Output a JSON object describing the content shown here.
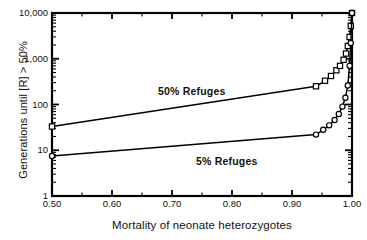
{
  "chart_data": {
    "type": "line",
    "title": "",
    "xlabel": "Mortality of neonate heterozygotes",
    "ylabel": "Generations until [R] > 50%",
    "xlim": [
      0.5,
      1.0
    ],
    "ylim": [
      1,
      10000
    ],
    "yscale": "log",
    "xscale": "linear",
    "grid": false,
    "legend_position": "inline-annotation",
    "xticks": [
      "0.50",
      "0.60",
      "0.70",
      "0.80",
      "0.90",
      "1.00"
    ],
    "xtick_values": [
      0.5,
      0.6,
      0.7,
      0.8,
      0.9,
      1.0
    ],
    "yticks": [
      "1",
      "10",
      "100",
      "1,000",
      "10,000"
    ],
    "ytick_values": [
      1,
      10,
      100,
      1000,
      10000
    ],
    "annotations": [
      {
        "text": "50%  Refuges",
        "x": 0.7,
        "y": 330
      },
      {
        "text": "5%  Refuges",
        "x": 0.79,
        "y": 17
      }
    ],
    "series": [
      {
        "name": "50% Refuges",
        "marker": "square",
        "x": [
          0.5,
          0.94,
          0.955,
          0.965,
          0.974,
          0.98,
          0.986,
          0.99,
          0.993,
          0.996,
          0.998,
          1.0
        ],
        "values": [
          33,
          250,
          330,
          420,
          560,
          700,
          950,
          1300,
          1900,
          3000,
          5200,
          10000
        ]
      },
      {
        "name": "5% Refuges",
        "marker": "circle",
        "x": [
          0.5,
          0.94,
          0.952,
          0.962,
          0.971,
          0.978,
          0.984,
          0.989,
          0.993,
          0.996,
          0.998,
          1.0
        ],
        "values": [
          7.5,
          22,
          28,
          35,
          46,
          62,
          90,
          140,
          260,
          700,
          2200,
          10000
        ]
      }
    ]
  },
  "axes": {
    "ylabel": "Generations until [R] > 50%",
    "xlabel": "Mortality of neonate heterozygotes"
  },
  "labels": {
    "refuges_50": "50%  Refuges",
    "refuges_5": "5%  Refuges"
  },
  "colors": {
    "line": "#000000",
    "axis": "#000000",
    "background": "#ffffff",
    "marker_fill": "#ffffff"
  }
}
